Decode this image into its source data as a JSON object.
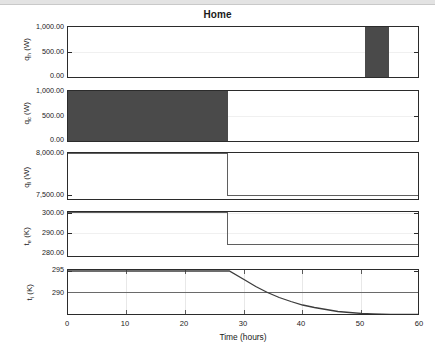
{
  "window": {
    "titlebar_present": true
  },
  "chart_data": {
    "type": "line",
    "title": "Home",
    "xlabel": "Time (hours)",
    "xlim": [
      0,
      60
    ],
    "xticks": [
      "0",
      "10",
      "20",
      "30",
      "40",
      "50",
      "60"
    ],
    "xtick_values": [
      0,
      10,
      20,
      30,
      40,
      50,
      60
    ],
    "grid": true,
    "legend": "none",
    "panels": [
      {
        "id": "qh",
        "ylabel": "q_h (W)",
        "ylabel_main": "q",
        "ylabel_sub": "h",
        "ylabel_unit": " (W)",
        "yticks": [
          "1,000.00",
          "500.00",
          "0.00"
        ],
        "ytick_values": [
          1000,
          500,
          0
        ],
        "ylim": [
          0,
          1000
        ],
        "series_name": "q_h",
        "style": "filled-step",
        "color": "#4a4a4a",
        "x": [
          0,
          51,
          51,
          55,
          55,
          60
        ],
        "y": [
          0,
          0,
          1000,
          1000,
          0,
          0
        ],
        "description": "Zero until hour 51, on at 1000 W from hour 51 to hour 55, then zero."
      },
      {
        "id": "qc",
        "ylabel": "q_c (W)",
        "ylabel_main": "q",
        "ylabel_sub": "c",
        "ylabel_unit": " (W)",
        "yticks": [
          "1,000.00",
          "500.00",
          "0.00"
        ],
        "ytick_values": [
          1000,
          500,
          0
        ],
        "ylim": [
          0,
          1000
        ],
        "series_name": "q_c",
        "style": "filled-step",
        "color": "#4a4a4a",
        "x": [
          0,
          27.4,
          27.4,
          60
        ],
        "y": [
          1000,
          1000,
          0,
          0
        ],
        "description": "1000 W from hour 0 to hour 27.4, then zero."
      },
      {
        "id": "ql",
        "ylabel": "q_l (W)",
        "ylabel_main": "q",
        "ylabel_sub": "l",
        "ylabel_unit": " (W)",
        "yticks": [
          "8,000.00",
          "7,500.00"
        ],
        "ytick_values": [
          8000,
          7500
        ],
        "ylim": [
          7450,
          8010
        ],
        "series_name": "q_l",
        "style": "step",
        "color": "#5f5f5f",
        "x": [
          0,
          27.5,
          27.5,
          60
        ],
        "y": [
          8000,
          8000,
          7500,
          7500
        ],
        "description": "8000 W until hour 27.5, steps down to 7500 W for the remainder."
      },
      {
        "id": "te",
        "ylabel": "t_e (K)",
        "ylabel_main": "t",
        "ylabel_sub": "e",
        "ylabel_unit": " (K)",
        "yticks": [
          "300.00",
          "290.00",
          "280.00"
        ],
        "ytick_values": [
          300,
          290,
          280
        ],
        "ylim": [
          278,
          304
        ],
        "series_name": "t_e",
        "style": "step",
        "color": "#5f5f5f",
        "x": [
          0,
          27.5,
          27.5,
          60
        ],
        "y": [
          303,
          303,
          285,
          285
        ],
        "description": "Outdoor temperature 303 K until hour 27.5, drops to 285 K afterwards."
      },
      {
        "id": "ti",
        "ylabel": "t_i (K)",
        "ylabel_main": "t",
        "ylabel_sub": "i",
        "ylabel_unit": " (K)",
        "yticks": [
          "295",
          "290"
        ],
        "ytick_values": [
          295,
          290
        ],
        "ylim": [
          286.2,
          295.4
        ],
        "series_name": "t_i",
        "style": "curve",
        "color": "#4a4a4a",
        "x": [
          0,
          27.5,
          30,
          32,
          34,
          36,
          38,
          40,
          42,
          44,
          46,
          48,
          50,
          52,
          55,
          60
        ],
        "y": [
          295.2,
          295.2,
          293.5,
          292.1,
          290.9,
          289.9,
          289.1,
          288.4,
          287.9,
          287.5,
          287.1,
          286.9,
          286.7,
          286.6,
          286.5,
          286.5
        ],
        "description": "Indoor temperature constant at 295.2 K until hour 27.5, then exponential decay crossing 290 K near hour 34 and levelling near 286.5 K by hour 50."
      }
    ]
  }
}
